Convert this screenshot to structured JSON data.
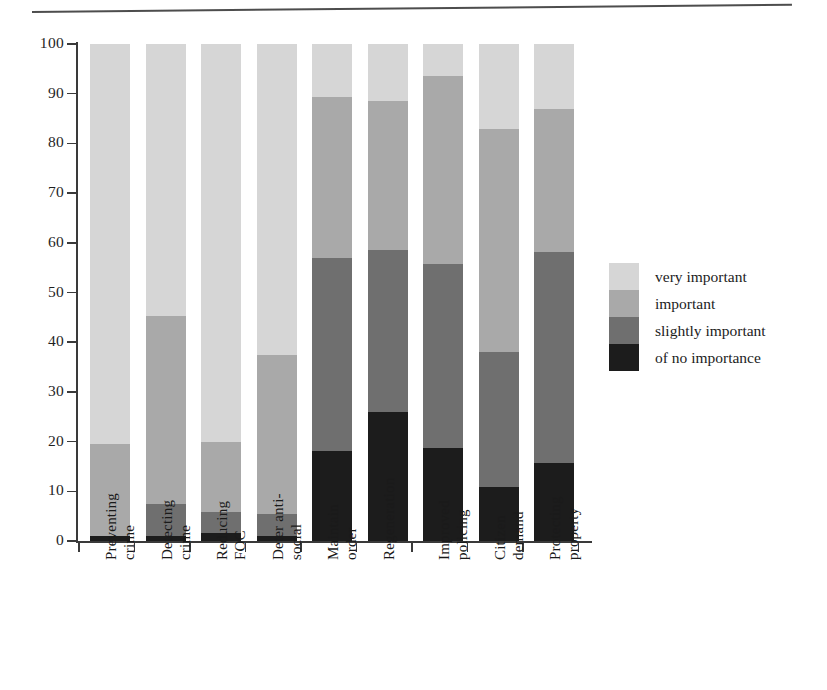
{
  "chart_data": {
    "type": "bar",
    "subtype": "stacked-bar-100",
    "title": "",
    "xlabel": "",
    "ylabel": "",
    "ylim": [
      0,
      100
    ],
    "yticks": [
      0,
      10,
      20,
      30,
      40,
      50,
      60,
      70,
      80,
      90,
      100
    ],
    "ytick_labels": [
      "0",
      "10",
      "20",
      "30",
      "40",
      "50",
      "60",
      "70",
      "80",
      "90",
      "100"
    ],
    "grid": false,
    "legend_position": "right",
    "categories": [
      "Preventing crime",
      "Detecting crime",
      "Reducing FOC",
      "Deter anti-social",
      "Maintain order",
      "Regeneration",
      "Improved policing",
      "Citizen demand",
      "Protecting property"
    ],
    "category_lines": [
      [
        "Preventing",
        "crime"
      ],
      [
        "Detecting",
        "crime"
      ],
      [
        "Reducing",
        "FOC"
      ],
      [
        "Deter anti-",
        "social"
      ],
      [
        "Maintain",
        "order"
      ],
      [
        "Regeneration",
        ""
      ],
      [
        "Improved",
        "policing"
      ],
      [
        "Citizen",
        "demand"
      ],
      [
        "Protecting",
        "property"
      ]
    ],
    "series": [
      {
        "name": "very important",
        "color": "#d6d6d6",
        "values": [
          80.5,
          54.7,
          80.0,
          62.6,
          10.7,
          11.5,
          6.5,
          17.1,
          13.0
        ]
      },
      {
        "name": "important",
        "color": "#a9a9a9",
        "values": [
          18.5,
          37.8,
          14.2,
          32.0,
          32.4,
          30.0,
          37.7,
          44.9,
          28.8
        ]
      },
      {
        "name": "slightly important",
        "color": "#6f6f6f",
        "values": [
          0.0,
          6.5,
          4.2,
          4.4,
          38.8,
          32.5,
          37.1,
          27.2,
          42.5
        ]
      },
      {
        "name": "of no importance",
        "color": "#1c1c1c",
        "values": [
          1.0,
          1.0,
          1.6,
          1.0,
          18.1,
          26.0,
          18.7,
          10.8,
          15.7
        ]
      }
    ]
  },
  "legend": {
    "entries": [
      {
        "label": "very important",
        "color": "#d6d6d6"
      },
      {
        "label": "important",
        "color": "#a9a9a9"
      },
      {
        "label": "slightly important",
        "color": "#6f6f6f"
      },
      {
        "label": "of no importance",
        "color": "#1c1c1c"
      }
    ]
  }
}
